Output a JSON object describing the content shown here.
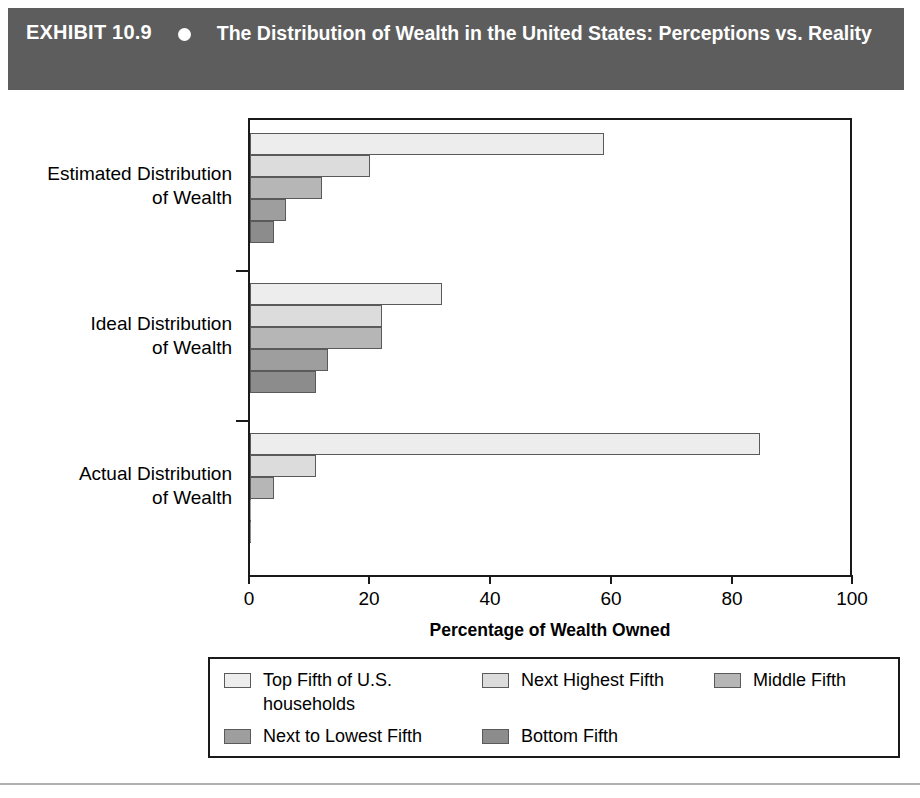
{
  "header": {
    "exhibit_label": "EXHIBIT 10.9",
    "bullet_icon": "bullet-dot-icon",
    "title": "The Distribution of Wealth in the United States: Perceptions vs. Reality",
    "background_color": "#5d5d5d",
    "text_color": "#ffffff"
  },
  "chart_data": {
    "type": "bar",
    "orientation": "horizontal",
    "title": "The Distribution of Wealth in the United States: Perceptions vs. Reality",
    "xlabel": "Percentage of Wealth Owned",
    "ylabel": "",
    "xlim": [
      0,
      100
    ],
    "xticks": [
      0,
      20,
      40,
      60,
      80,
      100
    ],
    "xtick_labels": [
      "0",
      "20",
      "40",
      "60",
      "80",
      "100"
    ],
    "grid": false,
    "legend_position": "bottom",
    "categories": [
      "Estimated Distribution\nof Wealth",
      "Ideal Distribution\nof Wealth",
      "Actual Distribution\nof Wealth"
    ],
    "series": [
      {
        "name": "Top Fifth of U.S. households",
        "color": "#ededed",
        "values": [
          59,
          32,
          85
        ]
      },
      {
        "name": "Next Highest Fifth",
        "color": "#dcdcdc",
        "values": [
          20,
          22,
          11
        ]
      },
      {
        "name": "Middle Fifth",
        "color": "#b6b6b6",
        "values": [
          12,
          22,
          4
        ]
      },
      {
        "name": "Next to Lowest Fifth",
        "color": "#9e9e9e",
        "values": [
          6,
          13,
          0.2
        ]
      },
      {
        "name": "Bottom Fifth",
        "color": "#8c8c8c",
        "values": [
          4,
          11,
          0.2
        ]
      }
    ]
  },
  "axis": {
    "x_title": "Percentage of Wealth Owned",
    "tick_0": "0",
    "tick_20": "20",
    "tick_40": "40",
    "tick_60": "60",
    "tick_80": "80",
    "tick_100": "100"
  },
  "categories": {
    "cat_0_line1": "Estimated Distribution",
    "cat_0_line2": "of Wealth",
    "cat_1_line1": "Ideal Distribution",
    "cat_1_line2": "of Wealth",
    "cat_2_line1": "Actual Distribution",
    "cat_2_line2": "of Wealth"
  },
  "legend": {
    "items": [
      {
        "label": "Top Fifth of U.S.\nhouseholds",
        "color": "#ededed"
      },
      {
        "label": "Next Highest Fifth",
        "color": "#dcdcdc"
      },
      {
        "label": "Middle Fifth",
        "color": "#b6b6b6"
      },
      {
        "label": "Next to Lowest Fifth",
        "color": "#9e9e9e"
      },
      {
        "label": "Bottom Fifth",
        "color": "#8c8c8c"
      }
    ]
  }
}
